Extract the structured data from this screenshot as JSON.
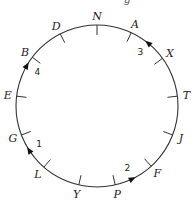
{
  "diagram": {
    "type": "circular-route",
    "clipped_top_text": "g",
    "circle": {
      "cx": 97,
      "cy": 106,
      "r": 81,
      "stroke": "#333333"
    },
    "points": [
      {
        "label": "N",
        "angle": 90
      },
      {
        "label": "A",
        "angle": 65
      },
      {
        "label": "X",
        "angle": 36
      },
      {
        "label": "T",
        "angle": 7
      },
      {
        "label": "J",
        "angle": -21
      },
      {
        "label": "F",
        "angle": -48
      },
      {
        "label": "P",
        "angle": -77
      },
      {
        "label": "Y",
        "angle": -103
      },
      {
        "label": "L",
        "angle": -131
      },
      {
        "label": "G",
        "angle": -159
      },
      {
        "label": "E",
        "angle": 173
      },
      {
        "label": "B",
        "angle": 143
      },
      {
        "label": "D",
        "angle": 117
      }
    ],
    "arrows": [
      {
        "number": "1",
        "angle": -147,
        "direction": "clockwise"
      },
      {
        "number": "2",
        "angle": -64,
        "direction": "counterclockwise"
      },
      {
        "number": "3",
        "angle": 51,
        "direction": "counterclockwise"
      },
      {
        "number": "4",
        "angle": 150,
        "direction": "clockwise"
      }
    ]
  }
}
